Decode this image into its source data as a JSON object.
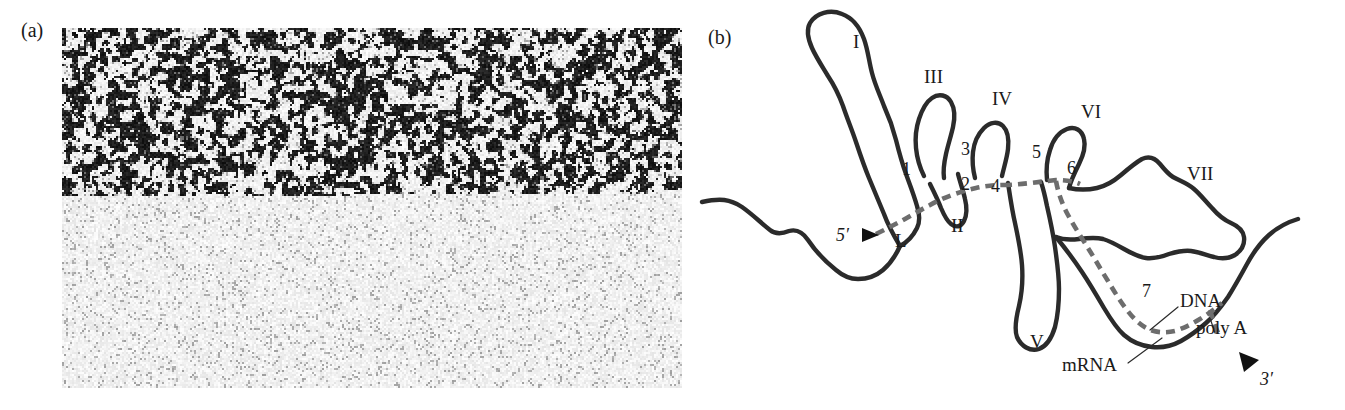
{
  "figure": {
    "type": "two-panel scientific figure",
    "panels": [
      {
        "id": "a",
        "letter": "(a)",
        "kind": "electron micrograph"
      },
      {
        "id": "b",
        "letter": "(b)",
        "kind": "interpretive line drawing"
      }
    ]
  },
  "panel_a": {
    "letter": "(a)",
    "description": "grainy dark-field electron micrograph of an R-loop hybrid spread"
  },
  "panel_b": {
    "letter": "(b)",
    "loop_labels": [
      {
        "id": "I",
        "text": "I",
        "x": 163,
        "y": 48
      },
      {
        "id": "II",
        "text": "II",
        "x": 267,
        "y": 228
      },
      {
        "id": "III",
        "text": "III",
        "x": 240,
        "y": 83
      },
      {
        "id": "IV",
        "text": "IV",
        "x": 307,
        "y": 101
      },
      {
        "id": "V",
        "text": "V",
        "x": 344,
        "y": 344
      },
      {
        "id": "VI",
        "text": "VI",
        "x": 393,
        "y": 116
      },
      {
        "id": "VII",
        "text": "VII",
        "x": 500,
        "y": 175
      }
    ],
    "exon_labels": [
      {
        "id": "1",
        "text": "1",
        "x": 213,
        "y": 172
      },
      {
        "id": "2",
        "text": "2",
        "x": 272,
        "y": 185
      },
      {
        "id": "3",
        "text": "3",
        "x": 272,
        "y": 150
      },
      {
        "id": "4",
        "text": "4",
        "x": 303,
        "y": 187
      },
      {
        "id": "5",
        "text": "5",
        "x": 345,
        "y": 155
      },
      {
        "id": "6",
        "text": "6",
        "x": 379,
        "y": 170
      },
      {
        "id": "7",
        "text": "7",
        "x": 456,
        "y": 293
      }
    ],
    "annotations": [
      {
        "id": "five-prime",
        "text": "5′",
        "x": 148,
        "y": 222
      },
      {
        "id": "three-prime",
        "text": "3′",
        "x": 575,
        "y": 385
      },
      {
        "id": "leader",
        "text": "L",
        "x": 212,
        "y": 240
      },
      {
        "id": "dna",
        "text": "DNA",
        "x": 492,
        "y": 300
      },
      {
        "id": "poly-a",
        "text": "poly A",
        "x": 512,
        "y": 328
      },
      {
        "id": "mrna",
        "text": "mRNA",
        "x": 390,
        "y": 370
      }
    ],
    "strands": {
      "dna_label": "DNA",
      "mrna_label": "mRNA",
      "poly_a_label": "poly A"
    }
  },
  "colors": {
    "dna_line": "#2b2b2b",
    "mrna_line": "#6d6d6d",
    "text": "#1a1a1a",
    "background": "#ffffff",
    "micrograph_dark": "#101010",
    "micrograph_light": "#f2f2f2"
  }
}
